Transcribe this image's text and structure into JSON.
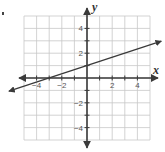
{
  "chart_data": {
    "type": "line",
    "title": "",
    "xlabel": "x",
    "ylabel": "y",
    "xlim": [
      -5,
      5
    ],
    "ylim": [
      -5,
      5
    ],
    "grid": true,
    "x_ticks": [
      -4,
      -2,
      2,
      4
    ],
    "y_ticks": [
      4,
      2,
      -2,
      -4
    ],
    "x_tick_labels": [
      "−4",
      "−2",
      "2",
      "4"
    ],
    "y_tick_labels": [
      "4",
      "2",
      "−2",
      "−4"
    ],
    "series": [
      {
        "name": "line",
        "equation": "y = (1/3)x + 1",
        "slope": 0.3333,
        "y_intercept": 1,
        "x_intercept": -3,
        "points": [
          [
            -6.3,
            -1.1
          ],
          [
            -3,
            0
          ],
          [
            0,
            1
          ],
          [
            3,
            2
          ],
          [
            6,
            3
          ]
        ],
        "arrows_both_ends": true
      }
    ]
  },
  "colors": {
    "grid": "#c8c8c8",
    "axis": "#3a3a3a",
    "line": "#3a3a3a",
    "background": "#ffffff"
  }
}
